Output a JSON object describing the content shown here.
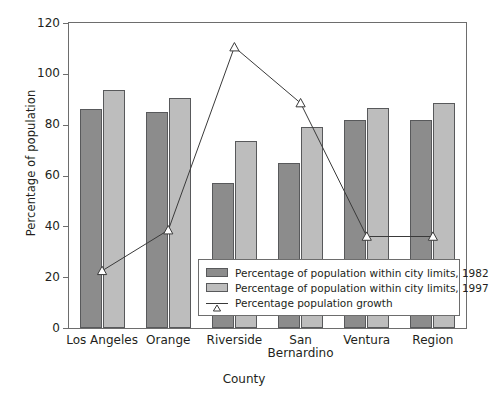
{
  "chart_data": {
    "type": "bar",
    "title": "",
    "xlabel": "County",
    "ylabel": "Percentage of population",
    "categories": [
      "Los Angeles",
      "Orange",
      "Riverside",
      "San Bernardino",
      "Ventura",
      "Region"
    ],
    "category_lines": [
      [
        "Los Angeles"
      ],
      [
        "Orange"
      ],
      [
        "Riverside"
      ],
      [
        "San",
        "Bernardino"
      ],
      [
        "Ventura"
      ],
      [
        "Region"
      ]
    ],
    "ylim": [
      0,
      120
    ],
    "yticks": [
      0,
      20,
      40,
      60,
      80,
      100,
      120
    ],
    "ytick_labels": [
      "0",
      "20",
      "40",
      "60",
      "80",
      "100",
      "120"
    ],
    "grid": false,
    "legend_position": "inside-lower-right",
    "series": [
      {
        "name": "Percentage of population within city limits, 1982",
        "type": "bar",
        "color": "#8c8c8c",
        "values": [
          86,
          85,
          57,
          65,
          82,
          82
        ]
      },
      {
        "name": "Percentage of population within city limits, 1997",
        "type": "bar",
        "color": "#bdbdbd",
        "values": [
          93.5,
          90.5,
          73.5,
          79,
          86.5,
          88.5
        ]
      },
      {
        "name": "Percentage population growth",
        "type": "line",
        "color": "#3a3a3a",
        "marker": "triangle-up-open",
        "values": [
          22.5,
          38.5,
          110.5,
          88.5,
          36,
          36
        ]
      }
    ]
  },
  "legend": {
    "items": [
      {
        "label": "Percentage of population within city limits, 1982",
        "marker": "swatch-dark"
      },
      {
        "label": "Percentage of population within city limits, 1997",
        "marker": "swatch-light"
      },
      {
        "label": "Percentage population growth",
        "marker": "line-triangle"
      }
    ]
  },
  "caption": {
    "cropped_text": ""
  }
}
